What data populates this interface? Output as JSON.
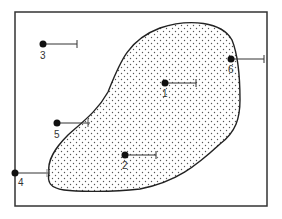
{
  "diagram": {
    "frame": {
      "x": 15,
      "y": 12,
      "width": 252,
      "height": 194
    },
    "region": {
      "fill_pattern": "dots",
      "stroke": "#222222"
    },
    "points": [
      {
        "label": "1",
        "x": 165,
        "y": 83,
        "bar_end_x": 196
      },
      {
        "label": "2",
        "x": 125,
        "y": 155,
        "bar_end_x": 156
      },
      {
        "label": "3",
        "x": 43,
        "y": 44,
        "bar_end_x": 77
      },
      {
        "label": "4",
        "x": 15,
        "y": 173,
        "bar_end_x": 49
      },
      {
        "label": "5",
        "x": 57,
        "y": 123,
        "bar_end_x": 90
      },
      {
        "label": "6",
        "x": 231,
        "y": 59,
        "bar_end_x": 264
      }
    ]
  }
}
